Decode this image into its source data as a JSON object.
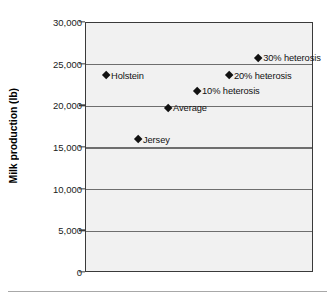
{
  "chart_data": {
    "type": "scatter",
    "title": "",
    "xlabel": "",
    "ylabel": "Milk production (lb)",
    "ylim": [
      0,
      30000
    ],
    "yticks": [
      0,
      5000,
      10000,
      15000,
      20000,
      25000,
      30000
    ],
    "ytick_labels": [
      "0",
      "5,000",
      "10,000",
      "15,000",
      "20,000",
      "25,000",
      "30,000"
    ],
    "grid": "horizontal",
    "legend": "none",
    "xaxis_visible": false,
    "points": [
      {
        "label": "30% heterosis",
        "x": 0.755,
        "y": 25800,
        "label_position": "right"
      },
      {
        "label": "Holstein",
        "x": 0.088,
        "y": 23700,
        "label_position": "right"
      },
      {
        "label": "20% heterosis",
        "x": 0.627,
        "y": 23700,
        "label_position": "right"
      },
      {
        "label": "10% heterosis",
        "x": 0.487,
        "y": 21800,
        "label_position": "right"
      },
      {
        "label": "Average",
        "x": 0.36,
        "y": 19800,
        "label_position": "right"
      },
      {
        "label": "Jersey",
        "x": 0.228,
        "y": 16000,
        "label_position": "right"
      }
    ]
  },
  "colors": {
    "plot_background": "#f1f1f1",
    "gridline": "#6e6e6e",
    "axis_border": "#3a3a3a",
    "marker": "#111111",
    "text": "#111111",
    "page_background": "#ffffff",
    "bottom_rule": "#a8a8a8"
  }
}
